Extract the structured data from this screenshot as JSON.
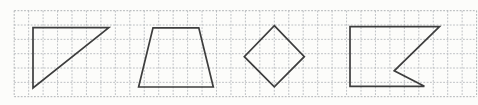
{
  "figure": {
    "width": 478,
    "height": 105,
    "background": "#fcfcfa"
  },
  "grid": {
    "x0": 14.2,
    "y0": 10.7,
    "cols": 32,
    "rows": 6,
    "dx": 14.45,
    "dy": 14.33,
    "line_color": "#b6b9bd",
    "border_color": "#a7aaae",
    "dash": "1.8 1.5",
    "line_width": 0.9
  },
  "shapes": {
    "stroke_color": "#3d3d3d",
    "stroke_width": 1.7,
    "items": [
      {
        "name": "right-triangle",
        "points": [
          [
            33,
            27.6
          ],
          [
            108.8,
            27.6
          ],
          [
            33,
            88
          ]
        ]
      },
      {
        "name": "trapezoid",
        "points": [
          [
            153,
            27.8
          ],
          [
            198.8,
            27.8
          ],
          [
            213.3,
            87
          ],
          [
            138.6,
            87
          ]
        ]
      },
      {
        "name": "rhombus",
        "points": [
          [
            274.3,
            25.7
          ],
          [
            304.3,
            56.7
          ],
          [
            274.3,
            86.9
          ],
          [
            244.3,
            56.7
          ]
        ]
      },
      {
        "name": "notched-flag-pentagon",
        "points": [
          [
            350,
            26.6
          ],
          [
            439.5,
            26.6
          ],
          [
            394.2,
            70.8
          ],
          [
            424.4,
            86.3
          ],
          [
            350,
            86.3
          ]
        ]
      }
    ]
  }
}
